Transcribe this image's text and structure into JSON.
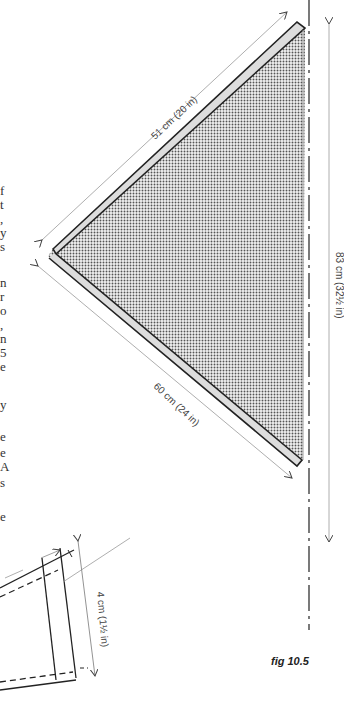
{
  "figure": {
    "caption": "fig 10.5",
    "measurements": {
      "top_edge": "51 cm (20 in)",
      "bottom_edge": "60 cm (24 in)",
      "right_edge": "83 cm (32½ in)",
      "detail_height": "4 cm (1½ in)"
    }
  },
  "clipped_text_fragments": [
    {
      "text": "f",
      "top": 184
    },
    {
      "text": "t",
      "top": 198
    },
    {
      "text": ",",
      "top": 212
    },
    {
      "text": "y",
      "top": 226
    },
    {
      "text": "s",
      "top": 240
    },
    {
      "text": "n",
      "top": 276
    },
    {
      "text": "r",
      "top": 290
    },
    {
      "text": "o",
      "top": 304
    },
    {
      "text": ",",
      "top": 318
    },
    {
      "text": "n",
      "top": 332
    },
    {
      "text": "5",
      "top": 346
    },
    {
      "text": "e",
      "top": 360
    },
    {
      "text": "y",
      "top": 398
    },
    {
      "text": "e",
      "top": 430
    },
    {
      "text": "e",
      "top": 446
    },
    {
      "text": "A",
      "top": 460
    },
    {
      "text": "s",
      "top": 476
    },
    {
      "text": "e",
      "top": 510
    }
  ]
}
